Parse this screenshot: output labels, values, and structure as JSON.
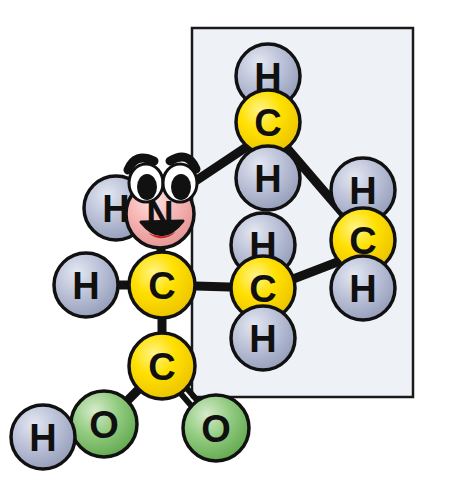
{
  "figure": {
    "background_color": "#ffffff"
  },
  "highlight_box": {
    "name": "side-chain-highlight-box",
    "x": 192,
    "y": 28,
    "width": 221,
    "height": 369,
    "fill_color": "#eef2f7",
    "stroke_color": "#1a1a1a",
    "stroke_width": 2.5
  },
  "palette": {
    "carbon_fill": "#ffe000",
    "carbon_fill_light": "#fff48a",
    "carbon_fill_dark": "#e8bd00",
    "hydrogen_fill": "#b9bfd6",
    "hydrogen_fill_light": "#dfe3ef",
    "hydrogen_fill_dark": "#9098b4",
    "oxygen_fill": "#8dc97c",
    "oxygen_fill_light": "#cfe8c5",
    "oxygen_fill_dark": "#5fa44c",
    "nitrogen_fill": "#f4b3b3",
    "nitrogen_fill_light": "#fde0dd",
    "nitrogen_fill_dark": "#e08b8b",
    "outline_color": "#111111",
    "bond_color": "#111111",
    "mouth_color": "#c42121",
    "eye_white": "#ffffff",
    "eye_pupil": "#111111"
  },
  "atoms": [
    {
      "id": "H-top",
      "element": "H",
      "label": "H",
      "cx": 268,
      "cy": 76,
      "r": 32,
      "kind": "hydrogen",
      "font_size": 38
    },
    {
      "id": "C-delta1",
      "element": "C",
      "label": "C",
      "cx": 268,
      "cy": 122,
      "r": 32,
      "kind": "carbon",
      "font_size": 38
    },
    {
      "id": "H-below-top",
      "element": "H",
      "label": "H",
      "cx": 268,
      "cy": 178,
      "r": 32,
      "kind": "hydrogen",
      "font_size": 38
    },
    {
      "id": "H-right-top",
      "element": "H",
      "label": "H",
      "cx": 363,
      "cy": 190,
      "r": 32,
      "kind": "hydrogen",
      "font_size": 38
    },
    {
      "id": "C-gamma",
      "element": "C",
      "label": "C",
      "cx": 363,
      "cy": 240,
      "r": 32,
      "kind": "carbon",
      "font_size": 38
    },
    {
      "id": "H-right-bot",
      "element": "H",
      "label": "H",
      "cx": 363,
      "cy": 288,
      "r": 32,
      "kind": "hydrogen",
      "font_size": 38
    },
    {
      "id": "H-mid-upper",
      "element": "H",
      "label": "H",
      "cx": 263,
      "cy": 245,
      "r": 32,
      "kind": "hydrogen",
      "font_size": 38
    },
    {
      "id": "C-beta",
      "element": "C",
      "label": "C",
      "cx": 263,
      "cy": 288,
      "r": 32,
      "kind": "carbon",
      "font_size": 38
    },
    {
      "id": "H-mid-lower",
      "element": "H",
      "label": "H",
      "cx": 263,
      "cy": 338,
      "r": 32,
      "kind": "hydrogen",
      "font_size": 38
    },
    {
      "id": "H-amine",
      "element": "H",
      "label": "H",
      "cx": 116,
      "cy": 208,
      "r": 32,
      "kind": "hydrogen",
      "font_size": 38
    },
    {
      "id": "N-amine",
      "element": "N",
      "label": "N",
      "cx": 160,
      "cy": 214,
      "r": 34,
      "kind": "nitrogen",
      "font_size": 38
    },
    {
      "id": "H-alpha",
      "element": "H",
      "label": "H",
      "cx": 86,
      "cy": 285,
      "r": 32,
      "kind": "hydrogen",
      "font_size": 38
    },
    {
      "id": "C-alpha",
      "element": "C",
      "label": "C",
      "cx": 162,
      "cy": 285,
      "r": 33,
      "kind": "carbon",
      "font_size": 38
    },
    {
      "id": "C-carboxyl",
      "element": "C",
      "label": "C",
      "cx": 162,
      "cy": 366,
      "r": 33,
      "kind": "carbon",
      "font_size": 38
    },
    {
      "id": "O-hydroxyl",
      "element": "O",
      "label": "O",
      "cx": 104,
      "cy": 424,
      "r": 33,
      "kind": "oxygen",
      "font_size": 38
    },
    {
      "id": "O-carbonyl",
      "element": "O",
      "label": "O",
      "cx": 216,
      "cy": 428,
      "r": 33,
      "kind": "oxygen",
      "font_size": 38
    },
    {
      "id": "H-hydroxyl",
      "element": "H",
      "label": "H",
      "cx": 43,
      "cy": 437,
      "r": 32,
      "kind": "hydrogen",
      "font_size": 38
    }
  ],
  "bonds": [
    {
      "id": "bond-Ctop-Hup",
      "from": "C-delta1",
      "to": "H-top",
      "order": 1,
      "x1": 268,
      "y1": 122,
      "x2": 268,
      "y2": 76
    },
    {
      "id": "bond-Ctop-Hdown",
      "from": "C-delta1",
      "to": "H-below-top",
      "order": 1,
      "x1": 268,
      "y1": 122,
      "x2": 268,
      "y2": 178
    },
    {
      "id": "bond-Ctop-Cgamma",
      "from": "C-delta1",
      "to": "C-gamma",
      "order": 1,
      "x1": 286,
      "y1": 147,
      "x2": 347,
      "y2": 218
    },
    {
      "id": "bond-Ctop-diagonal",
      "from": "C-delta1",
      "to": "N-amine",
      "order": 1,
      "x1": 248,
      "y1": 146,
      "x2": 179,
      "y2": 192
    },
    {
      "id": "bond-Cgamma-Hup",
      "from": "C-gamma",
      "to": "H-right-top",
      "order": 1,
      "x1": 363,
      "y1": 240,
      "x2": 363,
      "y2": 190
    },
    {
      "id": "bond-Cgamma-Hdown",
      "from": "C-gamma",
      "to": "H-right-bot",
      "order": 1,
      "x1": 363,
      "y1": 240,
      "x2": 363,
      "y2": 288
    },
    {
      "id": "bond-Cgamma-Cbeta",
      "from": "C-gamma",
      "to": "C-beta",
      "order": 1,
      "x1": 340,
      "y1": 261,
      "x2": 288,
      "y2": 281
    },
    {
      "id": "bond-Cbeta-Hup",
      "from": "C-beta",
      "to": "H-mid-upper",
      "order": 1,
      "x1": 263,
      "y1": 288,
      "x2": 263,
      "y2": 245
    },
    {
      "id": "bond-Cbeta-Hdown",
      "from": "C-beta",
      "to": "H-mid-lower",
      "order": 1,
      "x1": 263,
      "y1": 288,
      "x2": 263,
      "y2": 338
    },
    {
      "id": "bond-Calpha-Cbeta",
      "from": "C-alpha",
      "to": "C-beta",
      "order": 1,
      "x1": 162,
      "y1": 285,
      "x2": 263,
      "y2": 288
    },
    {
      "id": "bond-Calpha-N",
      "from": "C-alpha",
      "to": "N-amine",
      "order": 1,
      "x1": 162,
      "y1": 285,
      "x2": 160,
      "y2": 214
    },
    {
      "id": "bond-N-Hamine",
      "from": "N-amine",
      "to": "H-amine",
      "order": 1,
      "x1": 160,
      "y1": 214,
      "x2": 116,
      "y2": 208
    },
    {
      "id": "bond-Calpha-Halpha",
      "from": "C-alpha",
      "to": "H-alpha",
      "order": 1,
      "x1": 162,
      "y1": 285,
      "x2": 86,
      "y2": 285
    },
    {
      "id": "bond-Calpha-Ccarb",
      "from": "C-alpha",
      "to": "C-carboxyl",
      "order": 1,
      "x1": 162,
      "y1": 285,
      "x2": 162,
      "y2": 366
    },
    {
      "id": "bond-Ccarb-OH",
      "from": "C-carboxyl",
      "to": "O-hydroxyl",
      "order": 1,
      "x1": 162,
      "y1": 366,
      "x2": 104,
      "y2": 424
    },
    {
      "id": "bond-OH-H",
      "from": "O-hydroxyl",
      "to": "H-hydroxyl",
      "order": 1,
      "x1": 104,
      "y1": 424,
      "x2": 43,
      "y2": 437
    },
    {
      "id": "bond-Ccarb-O",
      "from": "C-carboxyl",
      "to": "O-carbonyl",
      "order": 2,
      "x1": 162,
      "y1": 366,
      "x2": 216,
      "y2": 428
    }
  ],
  "bond_style": {
    "stroke_width": 9,
    "double_bond_gap": 8,
    "double_bond_stroke_width": 6
  },
  "face": {
    "name": "nitrogen-cartoon-face",
    "attached_to": "N-amine",
    "left_eye": {
      "cx": 146,
      "cy": 183,
      "rx": 17,
      "ry": 19,
      "pupil_cx": 147,
      "pupil_cy": 187,
      "pupil_rx": 10,
      "pupil_ry": 13
    },
    "right_eye": {
      "cx": 180,
      "cy": 183,
      "rx": 17,
      "ry": 19,
      "pupil_cx": 181,
      "pupil_cy": 187,
      "pupil_rx": 10,
      "pupil_ry": 13
    },
    "left_brow_path": "M 128 170 Q 135 152 154 161",
    "right_brow_path": "M 170 161 Q 188 150 196 169",
    "mouth_path": "M 141 222 Q 162 248 183 221 Z",
    "tongue_path": "M 148 233 Q 162 244 176 232 Q 162 240 148 233 Z"
  }
}
